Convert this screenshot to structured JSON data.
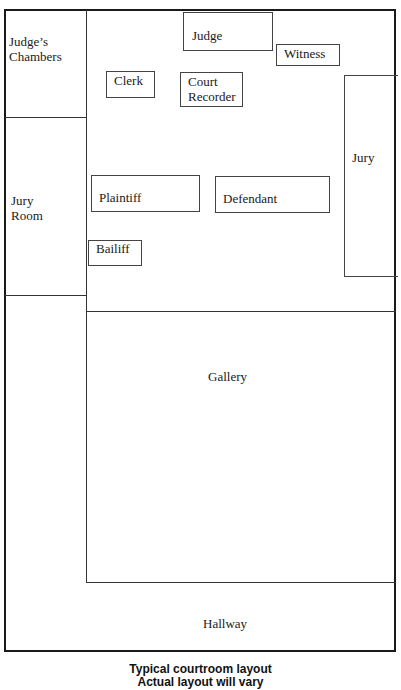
{
  "diagram": {
    "title": "Typical courtroom layout",
    "rooms": {
      "judges_chambers": "Judge’s\nChambers",
      "judges_chambers_line1": "Judge’s",
      "judges_chambers_line2": "Chambers",
      "jury_room_line1": "Jury",
      "jury_room_line2": "Room",
      "gallery": "Gallery",
      "hallway": "Hallway"
    },
    "positions": {
      "judge": "Judge",
      "witness": "Witness",
      "clerk": "Clerk",
      "court_recorder_line1": "Court",
      "court_recorder_line2": "Recorder",
      "jury": "Jury",
      "plaintiff": "Plaintiff",
      "defendant": "Defendant",
      "bailiff": "Bailiff"
    },
    "caption": {
      "line1": "Typical courtroom layout",
      "line2": "Actual layout will vary"
    },
    "colors": {
      "line": "#333333",
      "text": "#1a1a1a",
      "background": "#ffffff"
    }
  }
}
